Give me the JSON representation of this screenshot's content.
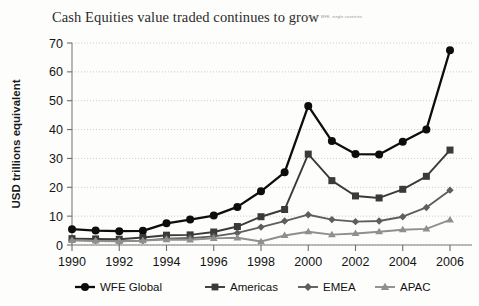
{
  "title": "Cash Equities value traded continues to grow",
  "source_note": "Source: WFE, single countries",
  "axis": {
    "ylabel": "USD trillions equivalent",
    "yticks": [
      "0",
      "10",
      "20",
      "30",
      "40",
      "50",
      "60",
      "70"
    ],
    "xticks": [
      "1990",
      "1992",
      "1994",
      "1996",
      "1998",
      "2000",
      "2002",
      "2004",
      "2006"
    ]
  },
  "legend": [
    {
      "label": "WFE Global",
      "marker": "circle",
      "color": "#0d0d0d"
    },
    {
      "label": "Americas",
      "marker": "square",
      "color": "#3a3a3a"
    },
    {
      "label": "EMEA",
      "marker": "diamond",
      "color": "#5e5e5e"
    },
    {
      "label": "APAC",
      "marker": "triangle",
      "color": "#8f8f8f"
    }
  ],
  "chart_data": {
    "type": "line",
    "title": "Cash Equities value traded continues to grow",
    "xlabel": "",
    "ylabel": "USD trillions equivalent",
    "xlim": [
      1990,
      2006
    ],
    "ylim": [
      0,
      70
    ],
    "grid": true,
    "legend_position": "bottom",
    "x": [
      1990,
      1991,
      1992,
      1993,
      1994,
      1995,
      1996,
      1997,
      1998,
      1999,
      2000,
      2001,
      2002,
      2003,
      2004,
      2005,
      2006
    ],
    "series": [
      {
        "name": "WFE Global",
        "marker": "circle",
        "color": "#0d0d0d",
        "values": [
          5.5,
          5.0,
          4.8,
          4.9,
          7.5,
          8.8,
          10.2,
          13.2,
          18.6,
          25.2,
          48.2,
          36.0,
          31.5,
          31.4,
          35.8,
          40.0,
          67.5
        ]
      },
      {
        "name": "Americas",
        "marker": "square",
        "color": "#3a3a3a",
        "values": [
          2.2,
          2.1,
          2.0,
          2.6,
          3.4,
          3.5,
          4.5,
          6.4,
          9.8,
          12.3,
          31.5,
          22.3,
          17.0,
          16.3,
          19.3,
          23.8,
          32.9
        ]
      },
      {
        "name": "EMEA",
        "marker": "diamond",
        "color": "#5e5e5e",
        "values": [
          1.7,
          1.5,
          1.3,
          1.5,
          2.2,
          2.4,
          3.0,
          4.2,
          6.2,
          8.3,
          10.5,
          8.8,
          8.1,
          8.3,
          9.8,
          13.0,
          19.0
        ]
      },
      {
        "name": "APAC",
        "marker": "triangle",
        "color": "#8f8f8f",
        "values": [
          1.6,
          1.4,
          1.3,
          1.5,
          1.9,
          1.8,
          2.3,
          2.5,
          1.2,
          3.3,
          4.6,
          3.6,
          4.0,
          4.6,
          5.3,
          5.6,
          8.7
        ]
      }
    ]
  }
}
